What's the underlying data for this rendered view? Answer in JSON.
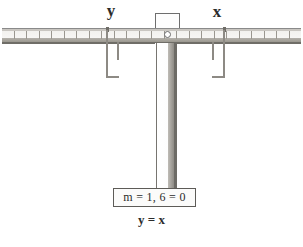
{
  "diagram": {
    "beam": {
      "tick_count": 24,
      "pivot_label": "pivot-hole",
      "color_top": "#c9c6c1",
      "color_face": "#f7f6f4",
      "color_shadow": "#6f6d67"
    },
    "labels": {
      "left": "y",
      "right": "x"
    },
    "hangers": [
      {
        "side": "left",
        "name": "hanger-y"
      },
      {
        "side": "right",
        "name": "hanger-x"
      }
    ],
    "readout": {
      "text": "m = 1, 6 = 0"
    },
    "caption": {
      "text": "y = x"
    },
    "colors": {
      "ink": "#2b2b2b",
      "metal": "#8d8a84",
      "outline": "#5d5b57",
      "background": "#ffffff"
    }
  }
}
